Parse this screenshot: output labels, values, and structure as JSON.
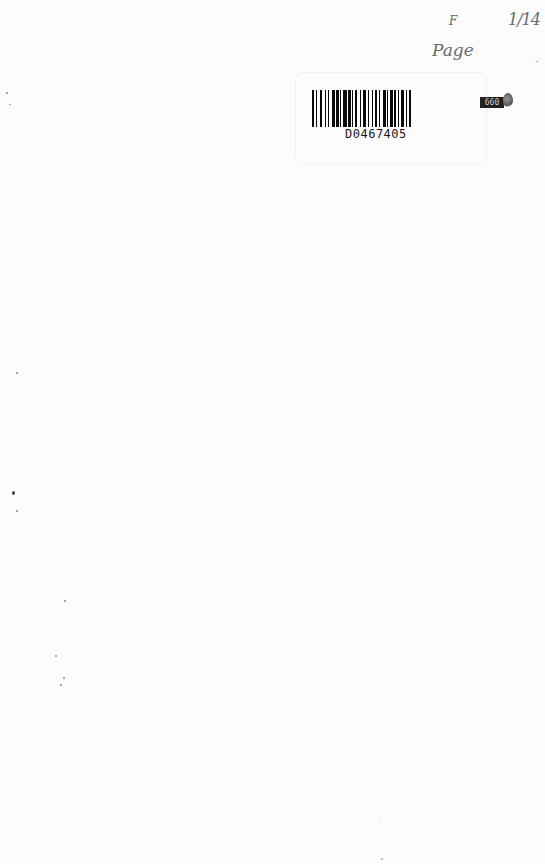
{
  "page": {
    "type": "scanned blank book page",
    "background_color": "#fcfcfc"
  },
  "handwriting": {
    "mark": "F",
    "fraction": "1/14",
    "word": "Page",
    "dash": "-"
  },
  "barcode": {
    "number": "D0467405"
  },
  "sticker": {
    "label": "660"
  }
}
